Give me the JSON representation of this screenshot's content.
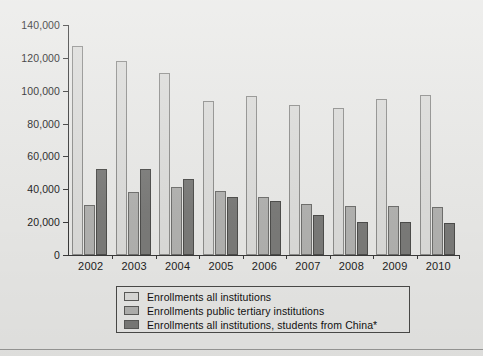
{
  "chart_data": {
    "type": "bar",
    "title": "",
    "xlabel": "",
    "ylabel": "",
    "categories": [
      "2002",
      "2003",
      "2004",
      "2005",
      "2006",
      "2007",
      "2008",
      "2009",
      "2010"
    ],
    "series": [
      {
        "name": "Enrollments all institutions",
        "color": "#dcdcda",
        "values": [
          127000,
          118000,
          110500,
          94000,
          96500,
          91500,
          89500,
          95000,
          97500
        ]
      },
      {
        "name": "Enrollments public tertiary institutions",
        "color": "#b2b2b0",
        "values": [
          30500,
          38500,
          41500,
          39000,
          35500,
          31000,
          30000,
          30000,
          29500
        ]
      },
      {
        "name": "Enrollments all institutions, students from China*",
        "color": "#7b7b79",
        "values": [
          52500,
          52500,
          46000,
          35500,
          33000,
          24500,
          20000,
          20000,
          19500
        ]
      }
    ],
    "ylim": [
      0,
      140000
    ],
    "ytick_values": [
      0,
      20000,
      40000,
      60000,
      80000,
      100000,
      120000,
      140000
    ],
    "ytick_labels": [
      "0",
      "20,000",
      "40,000",
      "60,000",
      "80,000",
      "100,000",
      "120,000",
      "140,000"
    ],
    "grid": false,
    "legend_position": "bottom"
  },
  "legend": {
    "items": [
      {
        "label": "Enrollments all institutions",
        "swatch": "s0"
      },
      {
        "label": "Enrollments public tertiary institutions",
        "swatch": "s1"
      },
      {
        "label": "Enrollments all institutions, students from China*",
        "swatch": "s2"
      }
    ]
  }
}
